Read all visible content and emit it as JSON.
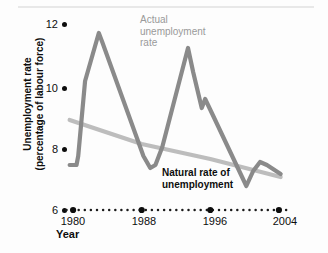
{
  "chart_data": {
    "type": "line",
    "title": "",
    "xlabel": "Year",
    "ylabel": "Unemployment rate (percentage of labour force)",
    "ylabel_line1": "Unemployment rate",
    "ylabel_line2": "(percentage of labour force)",
    "xlim": [
      1979,
      2005
    ],
    "ylim": [
      6,
      12.4
    ],
    "yticks": [
      6,
      8,
      10,
      12
    ],
    "ytick_labels": [
      "6",
      "8",
      "10",
      "12"
    ],
    "xticks": [
      1980,
      1988,
      1996,
      2004
    ],
    "xtick_labels": [
      "1980",
      "1988",
      "1996",
      "2004"
    ],
    "grid": false,
    "legend_position": "inline-annotations",
    "annotations": [
      {
        "name": "actual-unemployment-label",
        "text": "Actual unemployment rate",
        "lines": [
          "Actual",
          "unemployment",
          "rate"
        ],
        "color": "#9a9a9a"
      },
      {
        "name": "natural-rate-label",
        "text": "Natural rate of unemployment",
        "lines": [
          "Natural rate of",
          "unemployment"
        ],
        "color": "#0d0d0d"
      }
    ],
    "series": [
      {
        "name": "Actual unemployment rate",
        "color": "#8a8a8a",
        "x": [
          1979.6,
          1980.4,
          1980.6,
          1981.4,
          1983.0,
          1983.4,
          1988.2,
          1989.0,
          1989.6,
          1990.4,
          1993.4,
          1994.0,
          1995.0,
          1995.4,
          1996.4,
          2000.2,
          2001.0,
          2001.8,
          2002.6,
          2004.2
        ],
        "values": [
          7.5,
          7.5,
          7.8,
          10.3,
          11.9,
          11.6,
          7.8,
          7.4,
          7.5,
          8.1,
          11.4,
          10.6,
          9.4,
          9.7,
          9.1,
          6.8,
          7.3,
          7.6,
          7.5,
          7.2
        ]
      },
      {
        "name": "Natural rate of unemployment",
        "color": "#bdbdbd",
        "x": [
          1979.6,
          1988.0,
          1996.0,
          2004.2
        ],
        "values": [
          9.0,
          8.2,
          7.7,
          7.1
        ]
      }
    ]
  },
  "axis": {
    "y_tick_dot": "ytick-dot",
    "x_axis_style": "dotted"
  }
}
